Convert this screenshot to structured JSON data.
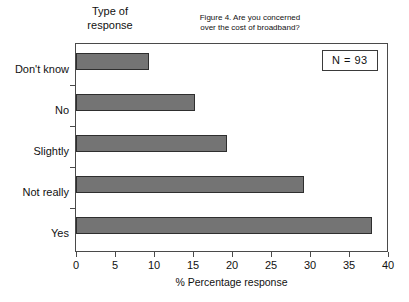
{
  "figure": {
    "caption_line1": "Figure 4.  Are you concerned",
    "caption_line2": "over the cost of broadband?",
    "y_group_title_line1": "Type of",
    "y_group_title_line2": "response",
    "sample_size_label": "N  = 93"
  },
  "chart_data": {
    "type": "bar",
    "orientation": "horizontal",
    "title": "Figure 4.  Are you concerned over the cost of broadband?",
    "categories": [
      "Don't  know",
      "No",
      "Slightly",
      "Not really",
      "Yes"
    ],
    "values": [
      9.3,
      15.3,
      19.3,
      29.2,
      38.0
    ],
    "xlabel": "% Percentage response",
    "ylabel": "Type of response",
    "xlim": [
      0,
      40
    ],
    "xticks": [
      0,
      5,
      10,
      15,
      20,
      25,
      30,
      35,
      40
    ],
    "xticklabels": [
      "0",
      "5",
      "10",
      "15",
      "20",
      "25",
      "30",
      "35",
      "40"
    ],
    "grid": false,
    "legend": null,
    "annotations": [
      "N  = 93"
    ],
    "bar_color": "#747474",
    "bar_edge_color": "#2e2e2e",
    "axis_color": "#4a4a4a",
    "background": "#ffffff"
  }
}
